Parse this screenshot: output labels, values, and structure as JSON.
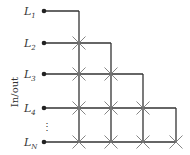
{
  "diagram": {
    "axis_label": "In/out",
    "lines": [
      {
        "name": "L",
        "sub": "1",
        "y": 11
      },
      {
        "name": "L",
        "sub": "2",
        "y": 43
      },
      {
        "name": "L",
        "sub": "3",
        "y": 74
      },
      {
        "name": "L",
        "sub": "4",
        "y": 108
      },
      {
        "name": "L",
        "sub": "N",
        "y": 142
      }
    ],
    "ellipsis": "⋮",
    "dot_x": 44,
    "verticals_x": [
      79,
      111,
      143,
      176
    ],
    "colors": {
      "line": "#333333",
      "cross": "#777777"
    }
  }
}
